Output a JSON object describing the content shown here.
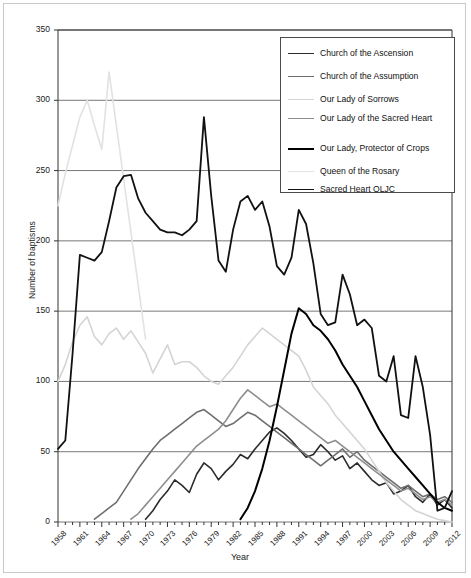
{
  "chart_data": {
    "type": "line",
    "title": "",
    "xlabel": "Year",
    "ylabel": "Number of baptisms",
    "xlim": [
      1958,
      2012
    ],
    "ylim": [
      0,
      350
    ],
    "ytick_step": 50,
    "xtick_step": 3,
    "xtick_minor_step": 1,
    "grid": "horizontal",
    "legend_position": "top-right",
    "yticks": [
      "0",
      "50",
      "100",
      "150",
      "200",
      "250",
      "300",
      "350"
    ],
    "xticks": [
      "1958",
      "1961",
      "1964",
      "1967",
      "1970",
      "1973",
      "1976",
      "1979",
      "1982",
      "1985",
      "1988",
      "1991",
      "1994",
      "1997",
      "2000",
      "2003",
      "2006",
      "2009",
      "2012"
    ],
    "x": [
      1958,
      1959,
      1960,
      1961,
      1962,
      1963,
      1964,
      1965,
      1966,
      1967,
      1968,
      1969,
      1970,
      1971,
      1972,
      1973,
      1974,
      1975,
      1976,
      1977,
      1978,
      1979,
      1980,
      1981,
      1982,
      1983,
      1984,
      1985,
      1986,
      1987,
      1988,
      1989,
      1990,
      1991,
      1992,
      1993,
      1994,
      1995,
      1996,
      1997,
      1998,
      1999,
      2000,
      2001,
      2002,
      2003,
      2004,
      2005,
      2006,
      2007,
      2008,
      2009,
      2010,
      2011,
      2012
    ],
    "series": [
      {
        "name": "Church of the Ascension",
        "color": "#2b2b2b",
        "width": 1.6,
        "values": [
          null,
          null,
          null,
          null,
          null,
          null,
          null,
          null,
          null,
          null,
          null,
          null,
          2,
          8,
          16,
          22,
          30,
          26,
          21,
          34,
          42,
          38,
          30,
          36,
          41,
          48,
          45,
          52,
          58,
          64,
          67,
          63,
          58,
          52,
          46,
          48,
          55,
          50,
          44,
          47,
          38,
          42,
          36,
          30,
          26,
          28,
          20,
          22,
          26,
          18,
          14,
          20,
          12,
          16,
          10
        ]
      },
      {
        "name": "Church of the Assumption",
        "color": "#6e6e6e",
        "width": 1.6,
        "values": [
          null,
          null,
          null,
          null,
          null,
          2,
          6,
          10,
          14,
          22,
          30,
          38,
          45,
          52,
          58,
          62,
          66,
          70,
          74,
          78,
          80,
          76,
          72,
          68,
          70,
          74,
          78,
          76,
          72,
          68,
          64,
          60,
          56,
          52,
          48,
          44,
          40,
          44,
          48,
          52,
          46,
          50,
          44,
          40,
          36,
          32,
          28,
          24,
          26,
          22,
          18,
          20,
          16,
          18,
          14
        ]
      },
      {
        "name": "Our Lady of Sorrows",
        "color": "#d4d4d4",
        "width": 1.6,
        "values": [
          100,
          112,
          128,
          140,
          146,
          132,
          126,
          134,
          138,
          130,
          136,
          128,
          120,
          106,
          116,
          126,
          112,
          114,
          114,
          110,
          104,
          100,
          98,
          104,
          110,
          118,
          126,
          132,
          138,
          134,
          130,
          126,
          122,
          118,
          108,
          96,
          90,
          84,
          76,
          70,
          64,
          58,
          52,
          44,
          36,
          28,
          22,
          16,
          12,
          8,
          6,
          4,
          2,
          1,
          0
        ]
      },
      {
        "name": "Our Lady of the Sacred Heart",
        "color": "#8e8e8e",
        "width": 1.6,
        "values": [
          null,
          null,
          null,
          null,
          null,
          null,
          null,
          null,
          null,
          null,
          2,
          6,
          12,
          18,
          24,
          30,
          36,
          42,
          48,
          54,
          58,
          62,
          66,
          72,
          80,
          88,
          94,
          90,
          86,
          82,
          84,
          80,
          76,
          72,
          68,
          64,
          60,
          56,
          58,
          54,
          50,
          46,
          42,
          38,
          34,
          30,
          26,
          22,
          24,
          20,
          16,
          18,
          14,
          16,
          12
        ]
      },
      {
        "name": "Our Lady, Protector of Crops",
        "color": "#000000",
        "width": 2.0,
        "values": [
          null,
          null,
          null,
          null,
          null,
          null,
          null,
          null,
          null,
          null,
          null,
          null,
          null,
          null,
          null,
          null,
          null,
          null,
          null,
          null,
          null,
          null,
          null,
          null,
          null,
          2,
          10,
          22,
          38,
          58,
          82,
          108,
          134,
          152,
          148,
          140,
          136,
          130,
          122,
          112,
          104,
          96,
          86,
          76,
          66,
          58,
          50,
          44,
          38,
          32,
          26,
          20,
          14,
          10,
          8
        ]
      },
      {
        "name": "Queen of the Rosary",
        "color": "#e2e2e2",
        "width": 1.6,
        "values": [
          225,
          248,
          268,
          288,
          300,
          282,
          265,
          320,
          282,
          244,
          206,
          168,
          130,
          null,
          null,
          null,
          null,
          null,
          null,
          null,
          null,
          null,
          null,
          null,
          null,
          null,
          null,
          null,
          null,
          null,
          null,
          null,
          null,
          null,
          null,
          null,
          null,
          null,
          null,
          null,
          null,
          null,
          null,
          null,
          null,
          null,
          null,
          null,
          null,
          null,
          null,
          null,
          null,
          null,
          null
        ]
      },
      {
        "name": "Sacred Heart OLJC",
        "color": "#111111",
        "width": 1.8,
        "values": [
          52,
          58,
          120,
          190,
          188,
          186,
          192,
          214,
          238,
          246,
          247,
          230,
          220,
          214,
          208,
          206,
          206,
          204,
          208,
          214,
          288,
          232,
          186,
          178,
          208,
          228,
          232,
          222,
          228,
          210,
          182,
          176,
          188,
          222,
          212,
          184,
          148,
          140,
          142,
          176,
          162,
          140,
          144,
          138,
          104,
          100,
          118,
          76,
          74,
          118,
          96,
          62,
          8,
          10,
          22
        ]
      }
    ]
  }
}
